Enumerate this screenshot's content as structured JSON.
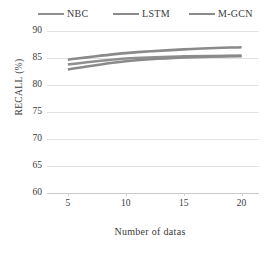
{
  "chart_data": {
    "type": "line",
    "title": "",
    "xlabel": "Number of datas",
    "ylabel": "RECALL (%)",
    "x": [
      5,
      10,
      15,
      20
    ],
    "xlim": [
      3.2,
      21.5
    ],
    "ylim": [
      60,
      90
    ],
    "xticks": [
      5,
      10,
      15,
      20
    ],
    "xtick_labels": [
      "5",
      "10",
      "15",
      "20"
    ],
    "yticks": [
      60,
      65,
      70,
      75,
      80,
      85,
      90
    ],
    "ytick_labels": [
      "60",
      "65",
      "70",
      "75",
      "80",
      "85",
      "90"
    ],
    "grid": "horizontal",
    "legend_position": "top",
    "series": [
      {
        "name": "NBC",
        "color": "#8f8f8f",
        "values": [
          83.8,
          84.9,
          85.3,
          85.4
        ]
      },
      {
        "name": "LSTM",
        "color": "#8a8a8a",
        "values": [
          82.9,
          84.4,
          85.1,
          85.4
        ]
      },
      {
        "name": "M-GCN",
        "color": "#8a8a8a",
        "values": [
          84.7,
          85.9,
          86.6,
          87.0
        ]
      }
    ]
  },
  "legend": {
    "items": [
      {
        "label": "NBC"
      },
      {
        "label": "LSTM"
      },
      {
        "label": "M-GCN"
      }
    ]
  },
  "colors": {
    "gridline": "#e2e2e2",
    "axis": "#c9c9c9",
    "text": "#3a3a3a",
    "series": "#8a8a8a",
    "background": "#ffffff"
  }
}
